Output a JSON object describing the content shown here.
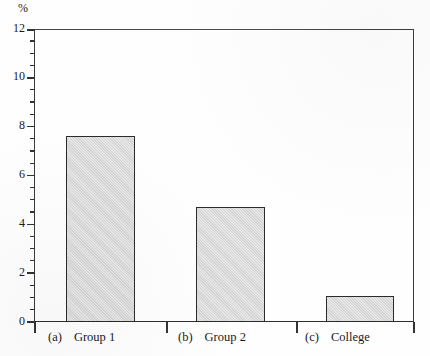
{
  "chart_data": {
    "type": "bar",
    "title": "",
    "subtitle": "",
    "xlabel": "",
    "ylabel": "%",
    "unit_label": "%",
    "categories": [
      "Group 1",
      "Group 2",
      "College"
    ],
    "category_tags": [
      "(a)",
      "(b)",
      "(c)"
    ],
    "values": [
      7.6,
      4.7,
      1.05
    ],
    "ylim": [
      0,
      12
    ],
    "ytick_labels": [
      "0",
      "2",
      "4",
      "6",
      "8",
      "10",
      "12"
    ],
    "ytick_values": [
      0,
      2,
      4,
      6,
      8,
      10,
      12
    ],
    "yminor_interval": 0.5,
    "grid": false,
    "legend": false,
    "legend_position": "none",
    "bar_fill_color": "#d9d9d9",
    "bar_edge_color": "#2b2b2b",
    "axis_color": "#333333",
    "background_color": "#ffffff"
  },
  "axis": {
    "unit": "%",
    "labels": {
      "y0": "0",
      "y2": "2",
      "y4": "4",
      "y6": "6",
      "y8": "8",
      "y10": "10",
      "y12": "12"
    }
  },
  "categories": [
    {
      "tag": "(a)",
      "name": "Group 1"
    },
    {
      "tag": "(b)",
      "name": "Group 2"
    },
    {
      "tag": "(c)",
      "name": "College"
    }
  ]
}
